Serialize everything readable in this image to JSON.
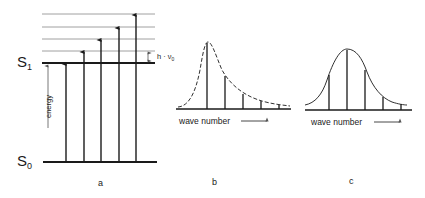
{
  "figure": {
    "panel_a": {
      "label": "a",
      "ground_state": "S",
      "ground_state_sub": "0",
      "excited_state": "S",
      "excited_state_sub": "1",
      "axis_label": "energy",
      "spacing_label": "h · ν",
      "spacing_label_sub": "0",
      "vibrational_levels_above_S1": 4,
      "transitions": 6
    },
    "panel_b": {
      "label": "b",
      "xlabel": "wave number",
      "description": "asymmetric band, maximum at 0-0 transition"
    },
    "panel_c": {
      "label": "c",
      "xlabel": "wave number",
      "description": "symmetric band, maximum at 0-1 transition"
    },
    "colors": {
      "ink": "#1a1a1a",
      "thin_line": "#888888",
      "background": "#ffffff"
    }
  }
}
